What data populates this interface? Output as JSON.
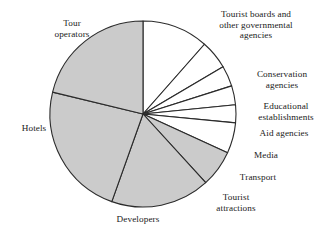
{
  "figure": {
    "background_color": "#ffffff",
    "width": 329,
    "height": 236
  },
  "chart_data": {
    "type": "pie",
    "title": "",
    "subtitle": "",
    "xlabel": "",
    "ylabel": "",
    "legend_position": "labels-outside",
    "grid": false,
    "start_angle_deg": 90,
    "direction": "clockwise",
    "center": {
      "x": 143,
      "y": 114
    },
    "radius": 93,
    "stroke_color": "#2b2b2b",
    "categories": [
      "Tourist boards and other governmental agencies",
      "Conservation agencies",
      "Educational establishments",
      "Aid agencies",
      "Media",
      "Transport",
      "Tourist attractions",
      "Developers",
      "Hotels",
      "Tour operators"
    ],
    "values": [
      11.5,
      5.0,
      3.6,
      3.3,
      3.1,
      5.3,
      6.4,
      17.2,
      23.3,
      21.3
    ],
    "slice_angles_deg": [
      41.4,
      18.0,
      13.0,
      11.9,
      11.2,
      19.1,
      23.0,
      62.0,
      84.0,
      76.4
    ],
    "slice_fills": [
      "#ffffff",
      "#ffffff",
      "#ffffff",
      "#ffffff",
      "#ffffff",
      "#ffffff",
      "#cbcbcb",
      "#cbcbcb",
      "#cbcbcb",
      "#cbcbcb"
    ],
    "fill_shaded": "#cbcbcb",
    "fill_plain": "#ffffff"
  },
  "labels": [
    {
      "id": "tourist-boards",
      "lines": [
        "Tourist boards and",
        "other governmental",
        "agencies"
      ],
      "text": "Tourist boards and\nother governmental\nagencies",
      "x": 196,
      "y": 9,
      "width": 120,
      "align": "ctr"
    },
    {
      "id": "conservation-agencies",
      "lines": [
        "Conservation",
        "agencies"
      ],
      "text": "Conservation\nagencies",
      "x": 240,
      "y": 69,
      "width": 84,
      "align": "ctr"
    },
    {
      "id": "educational-establishments",
      "lines": [
        "Educational",
        "establishments"
      ],
      "text": "Educational\nestablishments",
      "x": 244,
      "y": 101,
      "width": 84,
      "align": "ctr"
    },
    {
      "id": "aid-agencies",
      "lines": [
        "Aid agencies"
      ],
      "text": "Aid agencies",
      "x": 244,
      "y": 128,
      "width": 80,
      "align": "ctr"
    },
    {
      "id": "media",
      "lines": [
        "Media"
      ],
      "text": "Media",
      "x": 236,
      "y": 150,
      "width": 60,
      "align": "ctr"
    },
    {
      "id": "transport",
      "lines": [
        "Transport"
      ],
      "text": "Transport",
      "x": 224,
      "y": 172,
      "width": 68,
      "align": "ctr"
    },
    {
      "id": "tourist-attractions",
      "lines": [
        "Tourist",
        "attractions"
      ],
      "text": "Tourist\nattractions",
      "x": 200,
      "y": 192,
      "width": 72,
      "align": "ctr"
    },
    {
      "id": "developers",
      "lines": [
        "Developers"
      ],
      "text": "Developers",
      "x": 98,
      "y": 214,
      "width": 80,
      "align": "ctr"
    },
    {
      "id": "hotels",
      "lines": [
        "Hotels"
      ],
      "text": "Hotels",
      "x": 10,
      "y": 123,
      "width": 48,
      "align": "ctr"
    },
    {
      "id": "tour-operators",
      "lines": [
        "Tour",
        "operators"
      ],
      "text": "Tour\noperators",
      "x": 38,
      "y": 18,
      "width": 68,
      "align": "ctr"
    }
  ]
}
